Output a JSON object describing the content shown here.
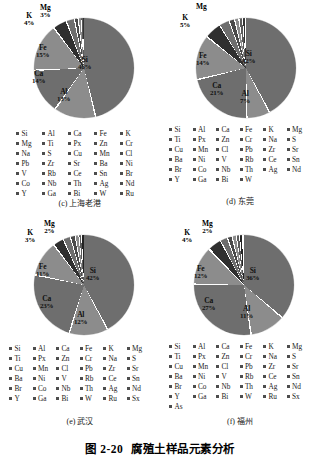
{
  "figure": {
    "number": "图 2-20",
    "title": "腐殖土样品元素分析"
  },
  "chart_data": [
    {
      "type": "pie",
      "id": "c",
      "title": "(c) 上海老港",
      "labels": [
        "Si",
        "Fe",
        "Ca",
        "Al",
        "K",
        "Mg"
      ],
      "values": [
        46,
        15,
        14,
        13,
        4,
        3
      ],
      "value_labels": [
        "46%",
        "15%",
        "14%",
        "13%",
        "4%",
        "3%"
      ],
      "legend_position": "bottom",
      "legend_columns": 5,
      "legend": [
        "Si",
        "Al",
        "Ca",
        "Fe",
        "K",
        "Mg",
        "Ti",
        "Px",
        "Zn",
        "Cr",
        "Na",
        "S",
        "Cu",
        "Mn",
        "Cl",
        "Pb",
        "Zr",
        "Sr",
        "Ba",
        "Ni",
        "V",
        "Rb",
        "Ce",
        "Sn",
        "Br",
        "Co",
        "Nb",
        "Th",
        "Ag",
        "Nd",
        "Y",
        "Ga",
        "Bi",
        "W",
        "Ru"
      ]
    },
    {
      "type": "pie",
      "id": "d",
      "title": "(d) 东莞",
      "labels": [
        "Si",
        "Ca",
        "Fe",
        "Al",
        "K",
        "Mg"
      ],
      "values": [
        42,
        21,
        14,
        7,
        5,
        3
      ],
      "value_labels": [
        "42%",
        "21%",
        "14%",
        "7%",
        "5%",
        ""
      ],
      "legend_position": "bottom",
      "legend_columns": 6,
      "legend": [
        "Si",
        "Al",
        "Ca",
        "Fe",
        "K",
        "Mg",
        "Ti",
        "Px",
        "Zn",
        "Cr",
        "Na",
        "S",
        "Cu",
        "Mn",
        "Cl",
        "Pb",
        "Zr",
        "Sr",
        "Ba",
        "Ni",
        "V",
        "Rb",
        "Ce",
        "Sn",
        "Br",
        "Co",
        "Nb",
        "Th",
        "Ag",
        "Nd",
        "Y",
        "Ga",
        "Bi",
        "W"
      ]
    },
    {
      "type": "pie",
      "id": "e",
      "title": "(e) 武汉",
      "labels": [
        "Si",
        "Ca",
        "Al",
        "Fe",
        "K",
        "Mg"
      ],
      "values": [
        42,
        23,
        12,
        11,
        3,
        2
      ],
      "value_labels": [
        "42%",
        "23%",
        "12%",
        "11%",
        "3%",
        "2%"
      ],
      "legend_position": "bottom",
      "legend_columns": 6,
      "legend": [
        "Si",
        "Al",
        "Ca",
        "Fe",
        "K",
        "Mg",
        "Ti",
        "Px",
        "Zn",
        "Cr",
        "Na",
        "S",
        "Cu",
        "Mn",
        "Cl",
        "Pb",
        "Zr",
        "Sr",
        "Ba",
        "Ni",
        "V",
        "Rb",
        "Ce",
        "Sn",
        "Br",
        "Co",
        "Nb",
        "Th",
        "Ag",
        "Nd",
        "Y",
        "Ga",
        "Bi",
        "W",
        "Ru",
        "Sx"
      ]
    },
    {
      "type": "pie",
      "id": "f",
      "title": "(f) 福州",
      "labels": [
        "Si",
        "Ca",
        "Fe",
        "Al",
        "K",
        "Mg"
      ],
      "values": [
        36,
        27,
        12,
        11,
        4,
        2
      ],
      "value_labels": [
        "36%",
        "27%",
        "12%",
        "11%",
        "4%",
        "2%"
      ],
      "legend_position": "bottom",
      "legend_columns": 6,
      "legend": [
        "Si",
        "Al",
        "Ca",
        "Fe",
        "K",
        "Mg",
        "Ti",
        "Px",
        "Zn",
        "Cr",
        "Na",
        "S",
        "Cu",
        "Mn",
        "Cl",
        "Pb",
        "Zr",
        "Sr",
        "Ba",
        "Ni",
        "V",
        "Rb",
        "Ce",
        "Sn",
        "Br",
        "Co",
        "Nb",
        "Th",
        "Ag",
        "Nd",
        "Y",
        "Ga",
        "Bi",
        "W",
        "Ru",
        "Sx",
        "As"
      ]
    }
  ],
  "colors": {
    "slice_primary": "#6e6e6e",
    "slice_secondary": "#8c8c8c",
    "slice_dark": "#3a3a3a",
    "swatch": "#4d4d4d",
    "background": "#ffffff"
  }
}
